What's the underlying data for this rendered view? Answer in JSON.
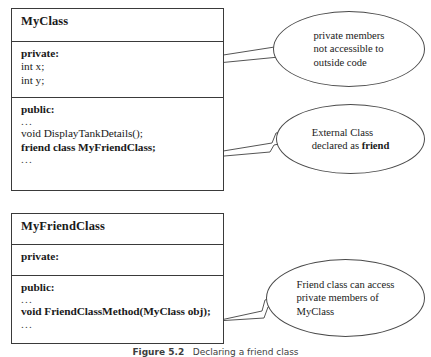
{
  "diagram": {
    "type": "uml-class-diagram",
    "caption": {
      "label": "Figure 5.2",
      "text": "Declaring a friend class",
      "full": "Figure 5.2   Declaring a friend class"
    },
    "classes": [
      {
        "id": "myclass",
        "name": "MyClass",
        "sections": [
          {
            "id": "private",
            "access_label": "private:",
            "members": [
              "int x;",
              "int y;"
            ],
            "leading_ellipsis": false,
            "trailing_ellipsis": false
          },
          {
            "id": "public",
            "access_label": "public:",
            "leading_ellipsis": "...",
            "members": [
              "void DisplayTankDetails();",
              "friend class MyFriendClass;"
            ],
            "members_bold": [
              false,
              true
            ],
            "trailing_ellipsis": "..."
          }
        ]
      },
      {
        "id": "myfriendclass",
        "name": "MyFriendClass",
        "sections": [
          {
            "id": "private",
            "access_label": "private:",
            "members": [],
            "leading_ellipsis": false,
            "trailing_ellipsis": false
          },
          {
            "id": "public",
            "access_label": "public:",
            "leading_ellipsis": "...",
            "members": [
              "void FriendClassMethod(MyClass obj);"
            ],
            "members_bold": [
              true
            ],
            "trailing_ellipsis": "..."
          }
        ]
      }
    ],
    "callouts": [
      {
        "id": "private-members",
        "shape": "ellipse",
        "text": "private members\nnot accessible to\noutside code",
        "target": "MyClass private section"
      },
      {
        "id": "external-friend",
        "shape": "ellipse",
        "text_prefix": "External Class\ndeclared as ",
        "text_bold": "friend",
        "target": "friend class MyFriendClass;"
      },
      {
        "id": "friend-access",
        "shape": "ellipse",
        "text": "Friend class can access\nprivate members of\nMyClass",
        "target": "MyFriendClass method"
      }
    ],
    "colors": {
      "stroke": "#3a3a3a",
      "callout_stroke": "#4a4a4a",
      "background": "#ffffff",
      "text": "#1a1a1a",
      "caption_text": "#3d3d3d"
    }
  }
}
